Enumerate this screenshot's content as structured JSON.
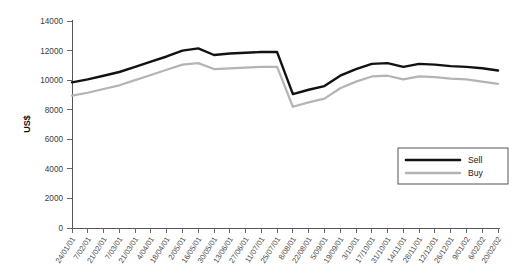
{
  "chart_data": {
    "type": "line",
    "title": "",
    "xlabel": "",
    "ylabel": "US$",
    "ylim": [
      0,
      14000
    ],
    "ytick_step": 2000,
    "yticks": [
      "0",
      "2000",
      "4000",
      "6000",
      "8000",
      "10000",
      "12000",
      "14000"
    ],
    "grid": false,
    "legend_position": "bottom-right",
    "categories": [
      "24/01/01",
      "7/02/01",
      "21/02/01",
      "7/03/01",
      "21/03/01",
      "4/04/01",
      "18/04/01",
      "2/05/01",
      "16/05/01",
      "30/05/01",
      "13/06/01",
      "27/06/01",
      "11/07/01",
      "25/07/01",
      "8/08/01",
      "22/08/01",
      "5/09/01",
      "19/09/01",
      "3/10/01",
      "17/10/01",
      "31/10/01",
      "14/11/01",
      "28/11/01",
      "12/12/01",
      "26/12/01",
      "9/01/02",
      "6/02/02",
      "20/02/02"
    ],
    "series": [
      {
        "name": "Sell",
        "color": "#121212",
        "values": [
          9850,
          10050,
          10300,
          10550,
          10900,
          11250,
          11600,
          12000,
          12150,
          11700,
          11800,
          11850,
          11900,
          11900,
          9050,
          9350,
          9600,
          10300,
          10750,
          11100,
          11150,
          10900,
          11100,
          11050,
          10950,
          10900,
          10800,
          10650
        ]
      },
      {
        "name": "Buy",
        "color": "#b4b4b4",
        "values": [
          8950,
          9150,
          9400,
          9650,
          10000,
          10350,
          10700,
          11050,
          11150,
          10750,
          10800,
          10850,
          10900,
          10900,
          8200,
          8500,
          8750,
          9450,
          9900,
          10250,
          10300,
          10050,
          10250,
          10200,
          10100,
          10050,
          9900,
          9750
        ]
      }
    ],
    "legend": [
      {
        "label": "Sell",
        "color": "#121212"
      },
      {
        "label": "Buy",
        "color": "#b4b4b4"
      }
    ]
  },
  "layout": {
    "plot_left": 72,
    "plot_right": 498,
    "plot_top": 21,
    "plot_bottom": 228,
    "legend_x": 398,
    "legend_y": 148,
    "legend_w": 110,
    "legend_h": 36
  }
}
